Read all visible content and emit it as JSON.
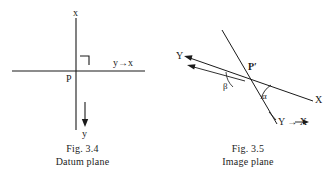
{
  "figures": [
    {
      "id": "datum",
      "caption_line1": "Fig. 3.4",
      "caption_line2": "Datum plane",
      "labels": {
        "axis_up": "x",
        "axis_right": "y→x",
        "origin": "P",
        "axis_down": "y"
      },
      "geometry": {
        "vertical_axis": {
          "x": 76,
          "y1": 18,
          "y2": 130
        },
        "horizontal_axis": {
          "y": 71,
          "x1": 12,
          "x2": 145
        },
        "right_angle_mark": {
          "x": 80,
          "y": 56,
          "size": 9
        },
        "down_arrow": {
          "x": 85,
          "y1": 104,
          "y2": 124
        }
      }
    },
    {
      "id": "image",
      "caption_line1": "Fig. 3.5",
      "caption_line2": "Image plane",
      "labels": {
        "axis_upper_left": "Y",
        "axis_right": "X",
        "origin": "P′",
        "angle_alpha": "α",
        "angle_beta": "β",
        "axis_lower_right": "Y → X"
      },
      "geometry": {
        "oblique_axis": {
          "x1": 20,
          "y1": 57,
          "x2": 148,
          "y2": 101
        },
        "steep_axis": {
          "x1": 57,
          "y1": 30,
          "x2": 112,
          "y2": 124
        },
        "parallel_arrow": {
          "x1": 22,
          "y1": 65,
          "x2": 78,
          "y2": 80
        },
        "intersection": {
          "x": 82,
          "y": 78
        }
      }
    }
  ],
  "style": {
    "ink_color": "#1a1a1a",
    "background_color": "#ffffff"
  }
}
